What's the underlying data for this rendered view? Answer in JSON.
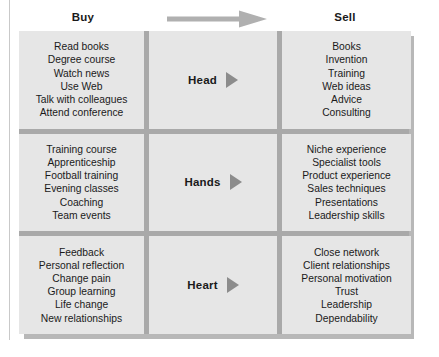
{
  "header": {
    "buy_label": "Buy",
    "sell_label": "Sell",
    "arrow_icon": "right-arrow-icon",
    "arrow_color": "#b0b0b0"
  },
  "theme": {
    "cell_background": "#e6e6e6",
    "divider_color": "#a9a9a9",
    "shadow_color": "#b8b8b8",
    "text_color": "#1a1a1a",
    "triangle_color": "#8c8c8c"
  },
  "rows": [
    {
      "middle_label": "Head",
      "middle_icon": "play-triangle-icon",
      "buy_items": [
        "Read books",
        "Degree course",
        "Watch news",
        "Use Web",
        "Talk with colleagues",
        "Attend conference"
      ],
      "sell_items": [
        "Books",
        "Invention",
        "Training",
        "Web ideas",
        "Advice",
        "Consulting"
      ]
    },
    {
      "middle_label": "Hands",
      "middle_icon": "play-triangle-icon",
      "buy_items": [
        "Training course",
        "Apprenticeship",
        "Football training",
        "Evening classes",
        "Coaching",
        "Team events"
      ],
      "sell_items": [
        "Niche experience",
        "Specialist tools",
        "Product experience",
        "Sales techniques",
        "Presentations",
        "Leadership skills"
      ]
    },
    {
      "middle_label": "Heart",
      "middle_icon": "play-triangle-icon",
      "buy_items": [
        "Feedback",
        "Personal reflection",
        "Change pain",
        "Group learning",
        "Life change",
        "New relationships"
      ],
      "sell_items": [
        "Close network",
        "Client relationships",
        "Personal motivation",
        "Trust",
        "Leadership",
        "Dependability"
      ]
    }
  ]
}
